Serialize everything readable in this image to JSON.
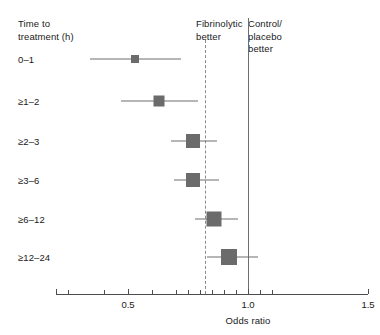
{
  "chart_data": {
    "type": "forest",
    "title": "",
    "xlabel": "Odds ratio",
    "ylabel": "Time to treatment (h)",
    "xlim": [
      0.2,
      1.5
    ],
    "x_major_ticks": [
      0.5,
      1.0,
      1.5
    ],
    "x_major_tick_labels": [
      "0.5",
      "1.0",
      "1.5"
    ],
    "x_minor_ticks": [
      0.25,
      0.4,
      0.6,
      0.7,
      0.75,
      0.8,
      0.85,
      0.9,
      0.95,
      1.05,
      1.1
    ],
    "grid": false,
    "legend": "none",
    "null_line": 1.0,
    "pooled_line": 0.82,
    "annotations": {
      "left_region": "Fibrinolytic\nbetter",
      "right_region": "Control/\nplacebo\nbetter"
    },
    "categories": [
      "0–1",
      "≥1–2",
      "≥2–3",
      "≥3–6",
      "≥6–12",
      "≥12–24"
    ],
    "odds_ratios": [
      0.53,
      0.63,
      0.77,
      0.77,
      0.86,
      0.92
    ],
    "ci_low": [
      0.34,
      0.47,
      0.68,
      0.69,
      0.78,
      0.83
    ],
    "ci_high": [
      0.72,
      0.79,
      0.87,
      0.88,
      0.96,
      1.04
    ],
    "marker_sizes": [
      8,
      11,
      14,
      14,
      15,
      16
    ],
    "marker_color": "#6b6b6b",
    "line_color": "#6e6e6e",
    "rows": [
      {
        "label": "0–1",
        "or": 0.53,
        "lo": 0.34,
        "hi": 0.72,
        "size": 8
      },
      {
        "label": "≥1–2",
        "or": 0.63,
        "lo": 0.47,
        "hi": 0.79,
        "size": 11
      },
      {
        "label": "≥2–3",
        "or": 0.77,
        "lo": 0.68,
        "hi": 0.87,
        "size": 14
      },
      {
        "label": "≥3–6",
        "or": 0.77,
        "lo": 0.69,
        "hi": 0.88,
        "size": 14
      },
      {
        "label": "≥6–12",
        "or": 0.86,
        "lo": 0.78,
        "hi": 0.96,
        "size": 15
      },
      {
        "label": "≥12–24",
        "or": 0.92,
        "lo": 0.83,
        "hi": 1.04,
        "size": 16
      }
    ]
  },
  "headers": {
    "time_to_treatment": "Time to\ntreatment (h)",
    "fibrinolytic_better": "Fibrinolytic\nbetter",
    "control_placebo_better": "Control/\nplacebo\nbetter"
  },
  "axis": {
    "title": "Odds ratio",
    "tick_labels": [
      "0.5",
      "1.0",
      "1.5"
    ]
  },
  "colors": {
    "marker": "#6b6b6b",
    "line": "#6e6e6e",
    "axis": "#4d4d4d",
    "pooled_dashed": "#8a8a8a",
    "text": "#1a1a1a",
    "background": "#ffffff"
  }
}
